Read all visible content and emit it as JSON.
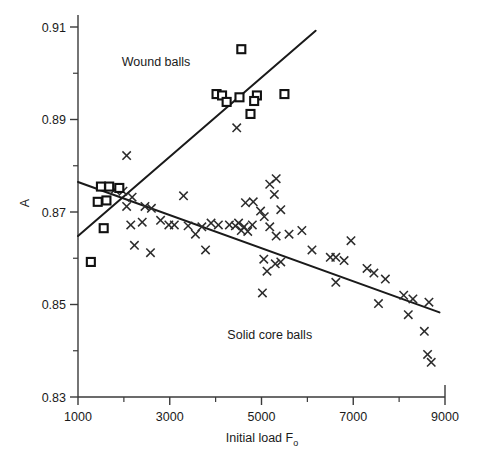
{
  "chart_data": {
    "type": "scatter",
    "title": "",
    "xlabel": "Initial load Fₒ",
    "ylabel": "A",
    "xlim": [
      1000,
      9000
    ],
    "ylim": [
      0.83,
      0.91
    ],
    "x_major_ticks": [
      1000,
      3000,
      5000,
      7000,
      9000
    ],
    "x_major_tick_labels": [
      "1000",
      "3000",
      "5000",
      "7000",
      "9000"
    ],
    "x_minor_ticks": [
      2000,
      4000,
      6000,
      8000
    ],
    "y_major_ticks": [
      0.83,
      0.85,
      0.87,
      0.89,
      0.91
    ],
    "y_major_tick_labels": [
      "0.83",
      "0.85",
      "0.87",
      "0.89",
      "0.91"
    ],
    "y_minor_ticks": [
      0.84,
      0.86,
      0.88,
      0.9
    ],
    "grid": false,
    "legend": "none",
    "annotations": [
      {
        "text": "Wound balls",
        "x": 2700,
        "y": 0.9015
      },
      {
        "text": "Solid core balls",
        "x": 5180,
        "y": 0.8425
      }
    ],
    "series": [
      {
        "name": "Wound balls",
        "marker": "square",
        "points": [
          [
            1500,
            0.8755
          ],
          [
            1680,
            0.8755
          ],
          [
            1900,
            0.8752
          ],
          [
            1430,
            0.8722
          ],
          [
            1620,
            0.8725
          ],
          [
            1560,
            0.8665
          ],
          [
            1280,
            0.8592
          ],
          [
            4020,
            0.8955
          ],
          [
            4140,
            0.8952
          ],
          [
            4240,
            0.8938
          ],
          [
            4560,
            0.9052
          ],
          [
            4900,
            0.8952
          ],
          [
            4840,
            0.894
          ],
          [
            4760,
            0.8912
          ],
          [
            5500,
            0.8955
          ],
          [
            4520,
            0.8948
          ]
        ]
      },
      {
        "name": "Solid core balls",
        "marker": "cross",
        "points": [
          [
            2060,
            0.8822
          ],
          [
            1800,
            0.8748
          ],
          [
            1980,
            0.8745
          ],
          [
            2180,
            0.8732
          ],
          [
            2060,
            0.8712
          ],
          [
            2460,
            0.8712
          ],
          [
            2600,
            0.8708
          ],
          [
            2150,
            0.8672
          ],
          [
            2400,
            0.8678
          ],
          [
            2800,
            0.8682
          ],
          [
            2980,
            0.8672
          ],
          [
            2230,
            0.8628
          ],
          [
            2580,
            0.8612
          ],
          [
            3300,
            0.8735
          ],
          [
            3100,
            0.8672
          ],
          [
            3400,
            0.867
          ],
          [
            3700,
            0.8668
          ],
          [
            3560,
            0.8652
          ],
          [
            3900,
            0.8676
          ],
          [
            4060,
            0.8672
          ],
          [
            3780,
            0.8618
          ],
          [
            4460,
            0.8882
          ],
          [
            4300,
            0.8672
          ],
          [
            4430,
            0.867
          ],
          [
            4500,
            0.8676
          ],
          [
            4620,
            0.8668
          ],
          [
            4560,
            0.866
          ],
          [
            4700,
            0.8658
          ],
          [
            4800,
            0.8672
          ],
          [
            4650,
            0.872
          ],
          [
            4820,
            0.8722
          ],
          [
            4980,
            0.8702
          ],
          [
            5060,
            0.869
          ],
          [
            5180,
            0.876
          ],
          [
            5320,
            0.8772
          ],
          [
            5280,
            0.8738
          ],
          [
            5420,
            0.8705
          ],
          [
            5180,
            0.8668
          ],
          [
            5320,
            0.8648
          ],
          [
            5600,
            0.8652
          ],
          [
            5050,
            0.8598
          ],
          [
            5120,
            0.8572
          ],
          [
            5300,
            0.8588
          ],
          [
            5420,
            0.8592
          ],
          [
            5020,
            0.8525
          ],
          [
            5880,
            0.866
          ],
          [
            6100,
            0.8618
          ],
          [
            6500,
            0.8602
          ],
          [
            6620,
            0.8602
          ],
          [
            6800,
            0.8595
          ],
          [
            6950,
            0.8638
          ],
          [
            6620,
            0.8548
          ],
          [
            7300,
            0.8578
          ],
          [
            7450,
            0.8568
          ],
          [
            7700,
            0.8555
          ],
          [
            7550,
            0.8502
          ],
          [
            8100,
            0.852
          ],
          [
            8300,
            0.8512
          ],
          [
            8200,
            0.8478
          ],
          [
            8650,
            0.8505
          ],
          [
            8550,
            0.8442
          ],
          [
            8620,
            0.8392
          ],
          [
            8700,
            0.8375
          ]
        ]
      }
    ],
    "fit_lines": [
      {
        "name": "wound-balls-trend",
        "series": "Wound balls",
        "x1": 1000,
        "y1": 0.8648,
        "x2": 6180,
        "y2": 0.9092
      },
      {
        "name": "solid-core-balls-trend",
        "series": "Solid core balls",
        "x1": 1000,
        "y1": 0.8765,
        "x2": 8880,
        "y2": 0.8483
      }
    ]
  },
  "geometry": {
    "plot_left": 78,
    "plot_right": 445,
    "plot_top": 27,
    "plot_bottom": 397
  }
}
